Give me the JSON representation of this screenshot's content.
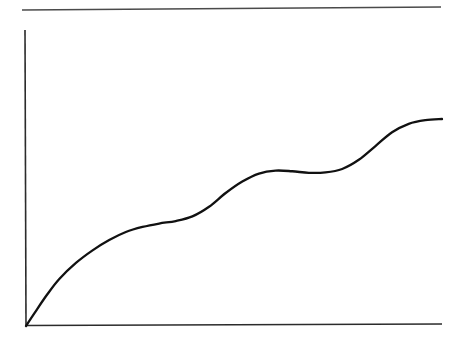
{
  "figure": {
    "kind": "line-chart",
    "title": "",
    "subtitle": "",
    "background_color": "#ffffff",
    "curve_color": "#111111",
    "axis_color": "#2b2b2b",
    "rule_color": "#4a4a4a",
    "alt_text": "Unlabeled hand-drawn line chart: a monotonically increasing curve with three step-like plateaus rising from the origin toward the upper right."
  },
  "chart_data": {
    "type": "line",
    "title": "",
    "subtitle": "",
    "xlabel": "",
    "ylabel": "",
    "xlim": [
      0,
      1
    ],
    "ylim": [
      0,
      1
    ],
    "grid": false,
    "legend": null,
    "legend_position": "none",
    "tick_labels_x": [],
    "tick_labels_y": [],
    "annotations": [],
    "series": [
      {
        "name": "curve",
        "color": "#111111",
        "x": [
          0.0,
          0.02,
          0.05,
          0.08,
          0.12,
          0.16,
          0.2,
          0.24,
          0.28,
          0.32,
          0.36,
          0.4,
          0.44,
          0.48,
          0.52,
          0.56,
          0.6,
          0.64,
          0.68,
          0.72,
          0.76,
          0.8,
          0.84,
          0.88,
          0.92,
          0.96,
          1.0
        ],
        "y": [
          0.0,
          0.055,
          0.135,
          0.205,
          0.275,
          0.33,
          0.375,
          0.41,
          0.432,
          0.447,
          0.458,
          0.478,
          0.52,
          0.58,
          0.63,
          0.665,
          0.678,
          0.675,
          0.668,
          0.67,
          0.685,
          0.725,
          0.785,
          0.845,
          0.882,
          0.898,
          0.903
        ]
      }
    ],
    "features": {
      "plateaus": 3,
      "plateau_1_x_range": [
        0.36,
        0.45
      ],
      "plateau_2_x_range": [
        0.6,
        0.72
      ],
      "plateau_3_x_range": [
        0.92,
        1.0
      ],
      "monotonic": "non-strictly increasing",
      "start_point": [
        0.0,
        0.0
      ],
      "end_point": [
        1.0,
        0.903
      ]
    }
  },
  "geometry": {
    "origin_px": [
      26,
      326
    ],
    "x_axis_end_px": [
      442,
      324
    ],
    "y_axis_top_px": [
      25,
      30
    ],
    "top_rule_start_px": [
      22,
      10
    ],
    "top_rule_end_px": [
      441,
      7
    ],
    "curve_end_px": [
      432,
      119
    ]
  }
}
